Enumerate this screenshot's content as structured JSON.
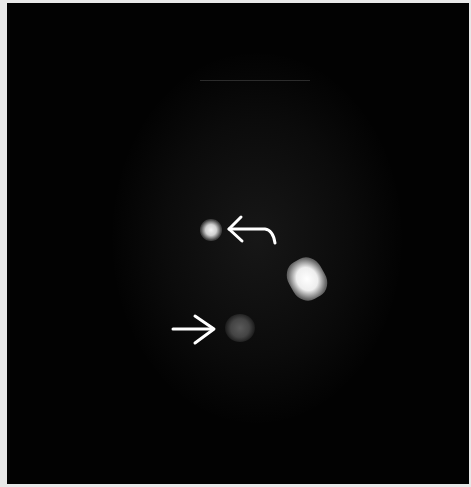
{
  "image": {
    "kind": "nuclear-medicine-scan",
    "background_color": "#020202",
    "frame_color": "#e8e8e8"
  },
  "findings": [
    {
      "name": "bright-focal-uptake",
      "cx": 210,
      "cy": 228,
      "intensity": "high"
    },
    {
      "name": "large-focal-uptake",
      "cx": 307,
      "cy": 276,
      "intensity": "very-high"
    },
    {
      "name": "faint-focal-uptake",
      "cx": 238,
      "cy": 325,
      "intensity": "low"
    }
  ],
  "annotations": [
    {
      "name": "curved-arrow",
      "direction": "left",
      "color": "#ffffff",
      "points_to": "bright-focal-uptake"
    },
    {
      "name": "straight-arrow",
      "direction": "right",
      "color": "#ffffff",
      "points_to": "faint-focal-uptake"
    }
  ]
}
